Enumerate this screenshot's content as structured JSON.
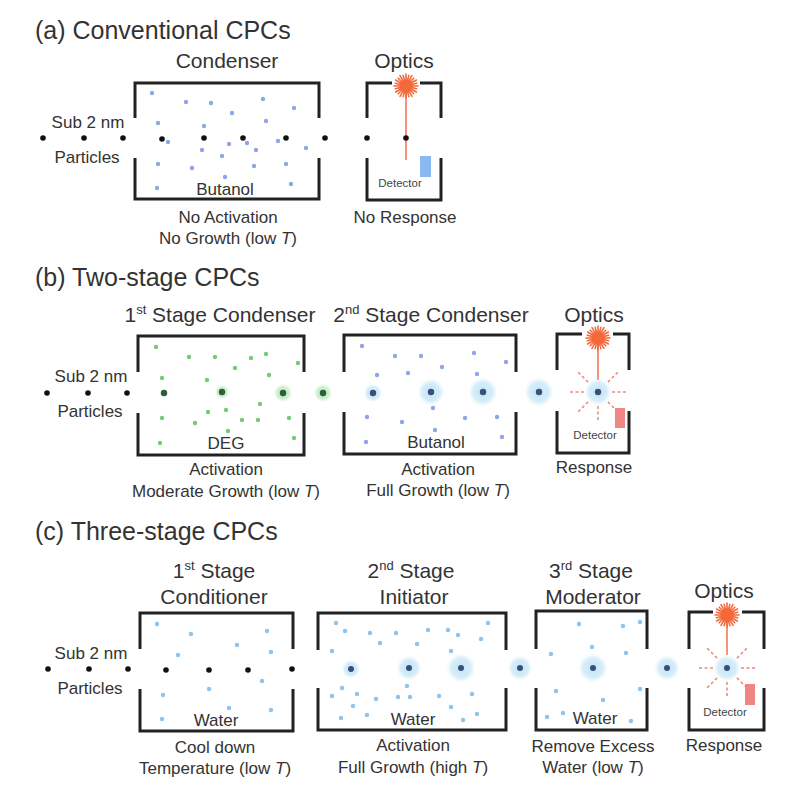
{
  "colors": {
    "text": "#333333",
    "wall": "#222222",
    "butanol": "#8ea6e8",
    "deg": "#74cc74",
    "water": "#8cc4ee",
    "particle_bare": "#111111",
    "particle_green": "#2f5f3a",
    "particle_blue": "#3a4f78",
    "halo_green": "#bdeabd",
    "halo_blue": "#cce9f8",
    "laser": "#f4683a",
    "detector_off": "#8ab8f0",
    "detector_on": "#f08585"
  },
  "panels": {
    "a": {
      "title": "(a) Conventional CPCs",
      "inlet": {
        "line1": "Sub 2 nm",
        "line2": "Particles"
      },
      "condenser": {
        "name": "Condenser",
        "fluid": "Butanol",
        "result_line1": "No Activation",
        "result_line2": {
          "pre": "No Growth (low ",
          "var": "T",
          "post": ")"
        },
        "droplets": {
          "r": 2.2,
          "color": "#8ea6e8",
          "item_name": "butanol-droplet",
          "points": [
            [
              152,
              93
            ],
            [
              186,
              102
            ],
            [
              211,
              103
            ],
            [
              232,
              113
            ],
            [
              263,
              99
            ],
            [
              294,
              108
            ],
            [
              158,
              123
            ],
            [
              204,
              126
            ],
            [
              266,
              121
            ],
            [
              168,
              142
            ],
            [
              202,
              150
            ],
            [
              229,
              144
            ],
            [
              247,
              143
            ],
            [
              256,
              150
            ],
            [
              278,
              141
            ],
            [
              306,
              148
            ],
            [
              222,
              156
            ],
            [
              158,
              164
            ],
            [
              192,
              168
            ],
            [
              254,
              166
            ],
            [
              286,
              164
            ],
            [
              225,
              177
            ],
            [
              157,
              188
            ],
            [
              291,
              184
            ]
          ]
        }
      },
      "optics": {
        "name": "Optics",
        "detector": "Detector",
        "result": "No Response"
      },
      "particles": {
        "r": 2.8,
        "color": "#111111",
        "halo_color": "none",
        "item_name": "bare-particle",
        "points": [
          [
            43,
            138,
            0
          ],
          [
            84,
            138,
            0
          ],
          [
            123,
            138,
            0
          ],
          [
            162,
            139,
            0
          ],
          [
            204,
            138,
            0
          ],
          [
            243,
            138,
            0
          ],
          [
            286,
            138,
            0
          ],
          [
            325,
            138,
            0
          ],
          [
            367,
            138,
            0
          ],
          [
            406,
            138,
            0
          ]
        ]
      }
    },
    "b": {
      "title": "(b) Two-stage CPCs",
      "inlet": {
        "line1": "Sub 2 nm",
        "line2": "Particles"
      },
      "stage1": {
        "ordinal": "1",
        "ordinal_suffix": "st",
        "name_rest": " Stage Condenser",
        "fluid": "DEG",
        "result_line1": "Activation",
        "result_line2": {
          "pre": "Moderate Growth (low ",
          "var": "T",
          "post": ")"
        },
        "droplets": {
          "r": 2.2,
          "color": "#74cc74",
          "item_name": "deg-droplet",
          "points": [
            [
              156,
              347
            ],
            [
              189,
              357
            ],
            [
              215,
              357
            ],
            [
              251,
              358
            ],
            [
              266,
              354
            ],
            [
              298,
              363
            ],
            [
              235,
              368
            ],
            [
              162,
              378
            ],
            [
              207,
              380
            ],
            [
              269,
              375
            ],
            [
              260,
              404
            ],
            [
              208,
              412
            ],
            [
              226,
              410
            ],
            [
              162,
              418
            ],
            [
              195,
              423
            ],
            [
              242,
              420
            ],
            [
              258,
              420
            ],
            [
              289,
              418
            ],
            [
              228,
              431
            ],
            [
              160,
              443
            ],
            [
              294,
              438
            ]
          ]
        }
      },
      "stage2": {
        "ordinal": "2",
        "ordinal_suffix": "nd",
        "name_rest": " Stage Condenser",
        "fluid": "Butanol",
        "result_line1": "Activation",
        "result_line2": {
          "pre": "Full Growth (low ",
          "var": "T",
          "post": ")"
        },
        "droplets": {
          "r": 2.2,
          "color": "#8ea6e8",
          "item_name": "butanol-droplet",
          "points": [
            [
              362,
              346
            ],
            [
              395,
              356
            ],
            [
              421,
              356
            ],
            [
              442,
              367
            ],
            [
              408,
              373
            ],
            [
              377,
              375
            ],
            [
              474,
              353
            ],
            [
              506,
              362
            ],
            [
              477,
              374
            ],
            [
              433,
              408
            ],
            [
              367,
              417
            ],
            [
              402,
              422
            ],
            [
              465,
              418
            ],
            [
              497,
              417
            ],
            [
              435,
              430
            ],
            [
              366,
              442
            ],
            [
              502,
              437
            ]
          ]
        }
      },
      "optics": {
        "name": "Optics",
        "detector": "Detector",
        "result": "Response"
      },
      "particles_bare": {
        "r": 2.8,
        "color": "#111111",
        "halo_color": "none",
        "item_name": "bare-particle",
        "points": [
          [
            47,
            393,
            0
          ],
          [
            88,
            393,
            0
          ],
          [
            127,
            393,
            0
          ]
        ]
      },
      "particles_green": {
        "r": 3.2,
        "color": "#2f5f3a",
        "halo_color": "url(#haloGreen)",
        "item_name": "deg-grown-particle",
        "points": [
          [
            164,
            393,
            4
          ],
          [
            222,
            392,
            7
          ],
          [
            283,
            393,
            9
          ],
          [
            323,
            393,
            9
          ]
        ]
      },
      "particles_blue": {
        "r": 3.2,
        "color": "#3a4f78",
        "halo_color": "url(#haloBlue)",
        "item_name": "butanol-grown-particle",
        "points": [
          [
            373,
            393,
            9
          ],
          [
            431,
            392,
            13
          ],
          [
            483,
            392,
            14
          ],
          [
            539,
            392,
            14
          ],
          [
            598,
            392,
            13
          ]
        ]
      }
    },
    "c": {
      "title": "(c) Three-stage CPCs",
      "inlet": {
        "line1": "Sub 2 nm",
        "line2": "Particles"
      },
      "stage1": {
        "ordinal": "1",
        "ordinal_suffix": "st",
        "name_rest": " Stage",
        "name_line2": "Conditioner",
        "fluid": "Water",
        "result_line1": "Cool down",
        "result_line2": {
          "pre": "Temperature (low ",
          "var": "T",
          "post": ")"
        },
        "droplets": {
          "r": 2.2,
          "color": "#8cc4ee",
          "item_name": "water-droplet",
          "points": [
            [
              157,
              624
            ],
            [
              191,
              634
            ],
            [
              267,
              631
            ],
            [
              237,
              645
            ],
            [
              178,
              655
            ],
            [
              271,
              652
            ],
            [
              262,
              681
            ],
            [
              209,
              689
            ],
            [
              163,
              695
            ],
            [
              229,
              708
            ],
            [
              271,
              710
            ],
            [
              162,
              719
            ]
          ]
        }
      },
      "stage2": {
        "ordinal": "2",
        "ordinal_suffix": "nd",
        "name_rest": " Stage",
        "name_line2": "Initiator",
        "fluid": "Water",
        "result_line1": "Activation",
        "result_line2": {
          "pre": "Full Growth (high ",
          "var": "T",
          "post": ")"
        },
        "droplets": {
          "r": 2.2,
          "color": "#8cc4ee",
          "item_name": "water-droplet",
          "points": [
            [
              336,
              623
            ],
            [
              345,
              631
            ],
            [
              370,
              633
            ],
            [
              396,
              633
            ],
            [
              380,
              643
            ],
            [
              428,
              630
            ],
            [
              448,
              630
            ],
            [
              458,
              635
            ],
            [
              488,
              623
            ],
            [
              481,
              639
            ],
            [
              417,
              644
            ],
            [
              332,
              651
            ],
            [
              451,
              651
            ],
            [
              342,
              688
            ],
            [
              407,
              686
            ],
            [
              332,
              696
            ],
            [
              357,
              694
            ],
            [
              376,
              699
            ],
            [
              398,
              697
            ],
            [
              410,
              697
            ],
            [
              439,
              696
            ],
            [
              472,
              694
            ],
            [
              353,
              706
            ],
            [
              451,
              707
            ],
            [
              341,
              718
            ],
            [
              367,
              715
            ],
            [
              463,
              720
            ],
            [
              477,
              714
            ]
          ]
        }
      },
      "stage3": {
        "ordinal": "3",
        "ordinal_suffix": "rd",
        "name_rest": " Stage",
        "name_line2": "Moderator",
        "fluid": "Water",
        "result_line1": "Remove Excess",
        "result_line2": {
          "pre": "Water (low ",
          "var": "T",
          "post": ")"
        },
        "droplets": {
          "r": 2.2,
          "color": "#8cc4ee",
          "item_name": "water-droplet",
          "points": [
            [
              579,
              624
            ],
            [
              623,
              626
            ],
            [
              640,
              622
            ],
            [
              592,
              647
            ],
            [
              551,
              654
            ],
            [
              626,
              653
            ],
            [
              556,
              691
            ],
            [
              603,
              700
            ],
            [
              640,
              689
            ],
            [
              563,
              713
            ],
            [
              547,
              717
            ],
            [
              631,
              721
            ]
          ]
        }
      },
      "optics": {
        "name": "Optics",
        "detector": "Detector",
        "result": "Response"
      },
      "particles_bare": {
        "r": 2.8,
        "color": "#111111",
        "halo_color": "none",
        "item_name": "bare-particle",
        "points": [
          [
            48,
            669,
            0
          ],
          [
            89,
            669,
            0
          ],
          [
            128,
            669,
            0
          ],
          [
            166,
            670,
            0
          ],
          [
            209,
            670,
            0
          ],
          [
            248,
            670,
            0
          ],
          [
            292,
            669,
            0
          ]
        ]
      },
      "particles_blue": {
        "r": 3.0,
        "color": "#3a4f78",
        "halo_color": "url(#haloBlue)",
        "item_name": "water-grown-particle",
        "points": [
          [
            351,
            669,
            9
          ],
          [
            409,
            668,
            12
          ],
          [
            461,
            668,
            14
          ],
          [
            520,
            668,
            12
          ],
          [
            593,
            668,
            14
          ],
          [
            667,
            668,
            12
          ],
          [
            727,
            668,
            13
          ]
        ]
      }
    }
  }
}
